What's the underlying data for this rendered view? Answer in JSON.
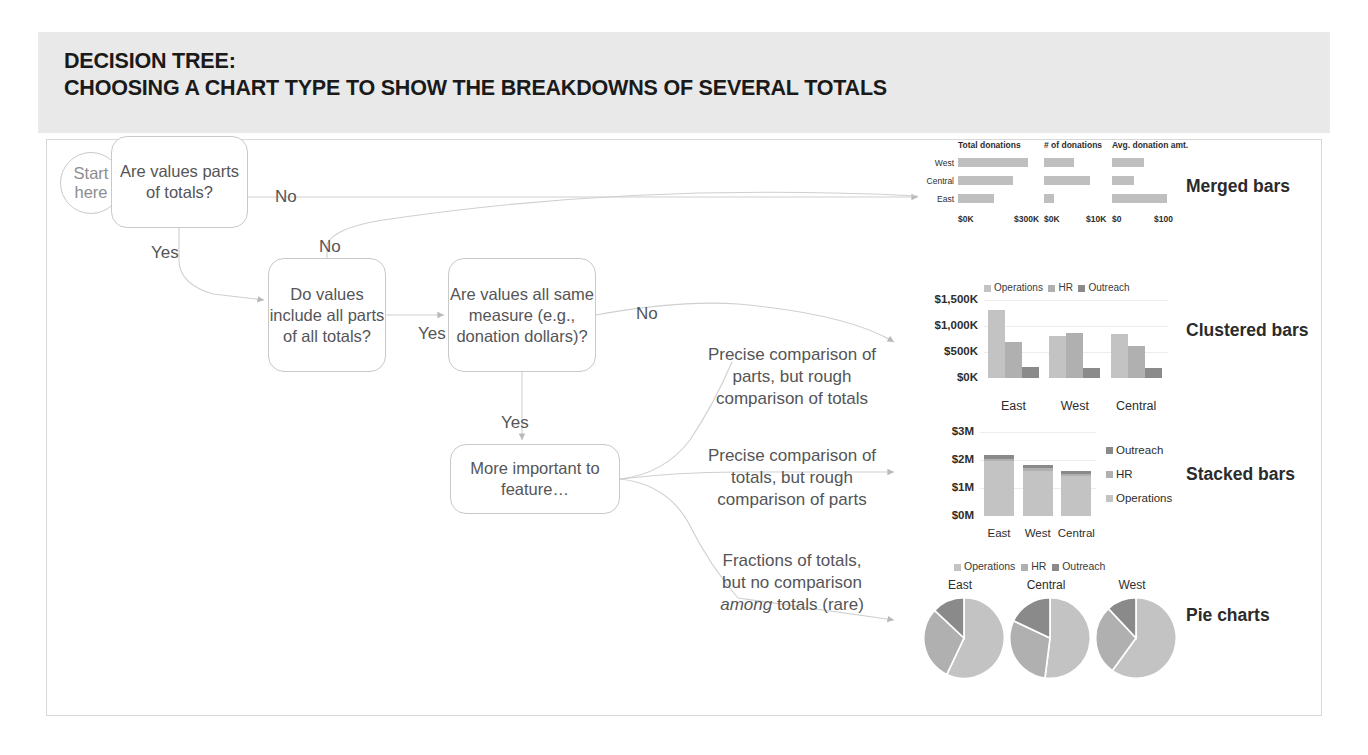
{
  "slide": {
    "title_line1": "DECISION TREE:",
    "title_line2": "CHOOSING A CHART TYPE TO SHOW THE BREAKDOWNS OF SEVERAL TOTALS"
  },
  "colors": {
    "band": "#e9e9e9",
    "node_border": "#c9c9c9",
    "text": "#555557",
    "operations": "#c3c3c3",
    "hr": "#b0b0b0",
    "outreach": "#8a8a8a",
    "bar_gray": "#bfbfbf",
    "grid": "#ededed"
  },
  "nodes": {
    "start": "Start here",
    "q1": "Are values parts of totals?",
    "q2": "Do values include all parts of all totals?",
    "q3": "Are values all same measure (e.g., donation dollars)?",
    "q4": "More important to feature…"
  },
  "edge_labels": {
    "q1_no": "No",
    "q1_yes": "Yes",
    "q2_no": "No",
    "q2_yes": "Yes",
    "q3_no": "No",
    "q3_yes": "Yes"
  },
  "outcome_descriptions": {
    "clustered": "Precise comparison of parts, but rough comparison of totals",
    "stacked": "Precise comparison of totals, but rough comparison of parts",
    "pie_line1": "Fractions of totals,",
    "pie_line2": "but no comparison",
    "pie_em": "among",
    "pie_line3": " totals (rare)"
  },
  "result_labels": {
    "merged": "Merged bars",
    "clustered": "Clustered bars",
    "stacked": "Stacked bars",
    "pie": "Pie charts"
  },
  "chart_data": [
    {
      "type": "bar",
      "id": "merged-bars",
      "title": "Merged bars",
      "orientation": "horizontal",
      "categories": [
        "West",
        "Central",
        "East"
      ],
      "panels": [
        {
          "name": "Total donations",
          "values": [
            290000,
            230000,
            150000
          ],
          "xlabel_min": "$0K",
          "xlabel_max": "$300K",
          "xlim": [
            0,
            300000
          ]
        },
        {
          "name": "# of donations",
          "values": [
            5200,
            8000,
            1700
          ],
          "xlabel_min": "$0K",
          "xlabel_max": "$10K",
          "xlim": [
            0,
            10000
          ]
        },
        {
          "name": "Avg. donation amt.",
          "values": [
            55,
            38,
            95
          ],
          "xlabel_min": "$0",
          "xlabel_max": "$100",
          "xlim": [
            0,
            100
          ]
        }
      ],
      "grid": false,
      "legend": "none"
    },
    {
      "type": "bar",
      "id": "clustered-bars",
      "title": "Clustered bars",
      "categories": [
        "East",
        "West",
        "Central"
      ],
      "series": [
        {
          "name": "Operations",
          "values": [
            1300000,
            800000,
            850000
          ],
          "color": "#c3c3c3"
        },
        {
          "name": "HR",
          "values": [
            700000,
            870000,
            620000
          ],
          "color": "#b0b0b0"
        },
        {
          "name": "Outreach",
          "values": [
            220000,
            200000,
            190000
          ],
          "color": "#8a8a8a"
        }
      ],
      "yticks": [
        "$0K",
        "$500K",
        "$1,000K",
        "$1,500K"
      ],
      "ylim": [
        0,
        1500000
      ],
      "grid": true,
      "legend": "top"
    },
    {
      "type": "bar",
      "id": "stacked-bars",
      "title": "Stacked bars",
      "stacked": true,
      "categories": [
        "East",
        "West",
        "Central"
      ],
      "series": [
        {
          "name": "Operations",
          "values": [
            1950000,
            1620000,
            1420000
          ],
          "color": "#c3c3c3"
        },
        {
          "name": "HR",
          "values": [
            90000,
            80000,
            70000
          ],
          "color": "#b0b0b0"
        },
        {
          "name": "Outreach",
          "values": [
            130000,
            110000,
            100000
          ],
          "color": "#8a8a8a"
        }
      ],
      "yticks": [
        "$0M",
        "$1M",
        "$2M",
        "$3M"
      ],
      "ylim": [
        0,
        3000000
      ],
      "grid": true,
      "legend": "right",
      "legend_order": [
        "Outreach",
        "HR",
        "Operations"
      ]
    },
    {
      "type": "pie",
      "id": "pie-charts",
      "title": "Pie charts",
      "legend": [
        "Operations",
        "HR",
        "Outreach"
      ],
      "legend_colors": [
        "#c3c3c3",
        "#b0b0b0",
        "#8a8a8a"
      ],
      "pies": [
        {
          "name": "East",
          "labels": [
            "Operations",
            "HR",
            "Outreach"
          ],
          "values": [
            57,
            30,
            13
          ]
        },
        {
          "name": "Central",
          "labels": [
            "Operations",
            "HR",
            "Outreach"
          ],
          "values": [
            52,
            30,
            18
          ]
        },
        {
          "name": "West",
          "labels": [
            "Operations",
            "HR",
            "Outreach"
          ],
          "values": [
            60,
            28,
            12
          ]
        }
      ]
    }
  ]
}
